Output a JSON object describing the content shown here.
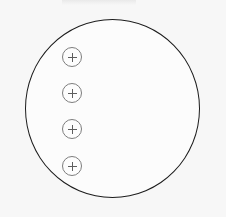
{
  "canvas": {
    "label": "diagram-canvas",
    "background_color": "#f7f7f7",
    "width": 226,
    "height": 217
  },
  "top_strip": {
    "label": "",
    "color": "#ebebeb"
  },
  "watermark": {
    "text": ""
  },
  "shape": {
    "name": "circle",
    "label": "",
    "stroke_color": "#1c1c1c",
    "fill_color": "#fcfcfc",
    "stroke_width": "1.4px",
    "center_x": 112,
    "center_y": 108,
    "radius_x": 87,
    "radius_y": 89
  },
  "handles": {
    "icon": "plus-icon",
    "stroke_color": "#7d7d7d",
    "glyph_color": "#5e5e5e",
    "items": [
      {
        "label": "",
        "index": 1,
        "x": 72,
        "y": 57
      },
      {
        "label": "",
        "index": 2,
        "x": 72,
        "y": 93
      },
      {
        "label": "",
        "index": 3,
        "x": 72,
        "y": 129
      },
      {
        "label": "",
        "index": 4,
        "x": 72,
        "y": 166
      }
    ]
  }
}
